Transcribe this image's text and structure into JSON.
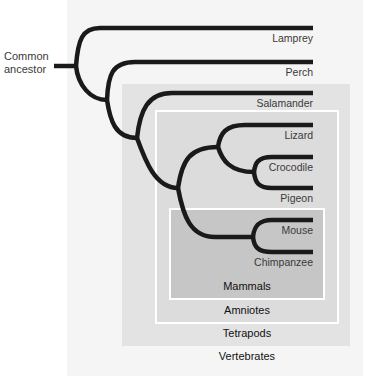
{
  "diagram": {
    "type": "phylogenetic-tree",
    "root_label": [
      "Common",
      "ancestor"
    ],
    "taxa": [
      {
        "name": "Lamprey",
        "y": 28
      },
      {
        "name": "Perch",
        "y": 62
      },
      {
        "name": "Salamander",
        "y": 93
      },
      {
        "name": "Lizard",
        "y": 125
      },
      {
        "name": "Crocodile",
        "y": 157
      },
      {
        "name": "Pigeon",
        "y": 188
      },
      {
        "name": "Mouse",
        "y": 220
      },
      {
        "name": "Chimpanzee",
        "y": 252
      }
    ],
    "groups": [
      {
        "name": "Mammals",
        "members": [
          "Mouse",
          "Chimpanzee"
        ]
      },
      {
        "name": "Amniotes",
        "members": [
          "Lizard",
          "Crocodile",
          "Pigeon",
          "Mouse",
          "Chimpanzee"
        ]
      },
      {
        "name": "Tetrapods",
        "members": [
          "Salamander",
          "Lizard",
          "Crocodile",
          "Pigeon",
          "Mouse",
          "Chimpanzee"
        ]
      },
      {
        "name": "Vertebrates",
        "members": [
          "Lamprey",
          "Perch",
          "Salamander",
          "Lizard",
          "Crocodile",
          "Pigeon",
          "Mouse",
          "Chimpanzee"
        ]
      }
    ],
    "colors": {
      "branch": "#1a1a1a",
      "vertebrates_fill": "#f5f5f5",
      "tetrapods_fill": "#e3e3e3",
      "amniotes_fill": "#dcdcdc",
      "mammals_fill": "#c6c6c6",
      "box_border": "#ffffff"
    }
  }
}
